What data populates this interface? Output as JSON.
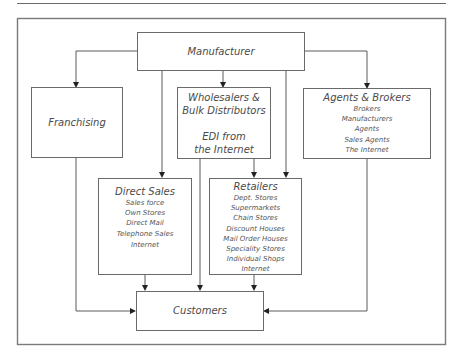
{
  "diagram": {
    "nodes": {
      "manufacturer": {
        "title": "Manufacturer"
      },
      "franchising": {
        "title": "Franchising"
      },
      "wholesalers": {
        "title_lines": [
          "Wholesalers &",
          "Bulk Distributors"
        ],
        "sub_lines": [
          "EDI from",
          "the Internet"
        ]
      },
      "agents": {
        "title": "Agents & Brokers",
        "items": [
          "Brokers",
          "Manufacturers",
          "Agents",
          "Sales Agents",
          "The Internet"
        ]
      },
      "direct_sales": {
        "title": "Direct Sales",
        "items": [
          "Sales force",
          "Own Stores",
          "Direct Mail",
          "Telephone Sales",
          "Internet"
        ]
      },
      "retailers": {
        "title": "Retailers",
        "items": [
          "Dept. Stores",
          "Supermarkets",
          "Chain Stores",
          "Discount Houses",
          "Mail Order Houses",
          "Speciality Stores",
          "Individual Shops",
          "Internet"
        ]
      },
      "customers": {
        "title": "Customers"
      }
    },
    "edges": [
      [
        "Manufacturer",
        "Franchising"
      ],
      [
        "Manufacturer",
        "Wholesalers & Bulk Distributors"
      ],
      [
        "Manufacturer",
        "Agents & Brokers"
      ],
      [
        "Manufacturer",
        "Direct Sales"
      ],
      [
        "Manufacturer",
        "Retailers"
      ],
      [
        "Wholesalers & Bulk Distributors",
        "Retailers"
      ],
      [
        "Wholesalers & Bulk Distributors",
        "Customers"
      ],
      [
        "Franchising",
        "Customers"
      ],
      [
        "Direct Sales",
        "Customers"
      ],
      [
        "Retailers",
        "Customers"
      ],
      [
        "Agents & Brokers",
        "Customers"
      ]
    ]
  }
}
